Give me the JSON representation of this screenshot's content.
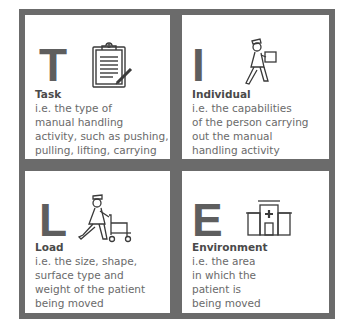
{
  "cards": [
    {
      "letter": "T",
      "title": "Task",
      "description": "i.e. the type of\nmanual handling\nactivity, such as pushing,\npulling, lifting, carrying",
      "icon": "clipboard-icon"
    },
    {
      "letter": "I",
      "title": "Individual",
      "description": "i.e. the capabilities\nof the person carrying\nout the manual\nhandling activity",
      "icon": "person-carrying-box-icon"
    },
    {
      "letter": "L",
      "title": "Load",
      "description": "i.e. the size, shape,\nsurface type and\nweight of the patient\nbeing moved",
      "icon": "nurse-with-walker-icon"
    },
    {
      "letter": "E",
      "title": "Environment",
      "description": "i.e. the area\nin which the\npatient is\nbeing moved",
      "icon": "hospital-building-icon"
    }
  ],
  "colors": {
    "border": "#6b6b6b",
    "letter": "#5e5e5e",
    "title": "#4a4a4a",
    "text": "#6a6a6a"
  }
}
